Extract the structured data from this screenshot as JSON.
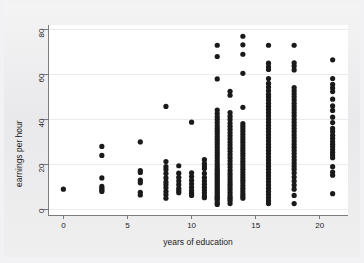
{
  "chart_data": {
    "type": "scatter",
    "title": "",
    "xlabel": "years of education",
    "ylabel": "earnings per hour",
    "xlim": [
      -1.2,
      22.2
    ],
    "ylim": [
      -2.5,
      82
    ],
    "xticks": [
      0,
      5,
      10,
      15,
      20
    ],
    "xtick_labels": [
      "0",
      "5",
      "10",
      "15",
      "20"
    ],
    "yticks": [
      0,
      20,
      40,
      60,
      80
    ],
    "ytick_labels": [
      "0",
      "20",
      "40",
      "60",
      "80"
    ],
    "grid": "horizontal",
    "grid_color": "#e6e6e6",
    "marker": "circle",
    "marker_color": "#1a1a1a",
    "marker_size": 2.6,
    "legend": "none",
    "background": "#ffffff",
    "figure_background": "#ececee",
    "series": [
      {
        "name": "earnings vs education",
        "points_by_x": [
          {
            "x": 0,
            "y": [
              9.0
            ]
          },
          {
            "x": 3,
            "y": [
              28.0,
              24.0,
              14.0,
              10.2,
              9.4,
              8.6,
              8.0
            ]
          },
          {
            "x": 6,
            "y": [
              30.0,
              17.3,
              16.4,
              13.0,
              11.8,
              7.6,
              6.4
            ]
          },
          {
            "x": 8,
            "y": [
              45.8,
              21.3,
              19.0,
              17.7,
              16.0,
              14.0,
              12.2,
              11.0,
              9.6,
              8.0,
              6.6,
              5.0
            ]
          },
          {
            "x": 9,
            "y": [
              19.4,
              16.1,
              14.2,
              12.6,
              11.0,
              9.3,
              8.2,
              7.4
            ]
          },
          {
            "x": 10,
            "y": [
              38.8,
              16.3,
              14.6,
              12.9,
              11.4,
              9.8,
              8.4,
              7.2,
              6.2
            ]
          },
          {
            "x": 11,
            "y": [
              22.1,
              20.4,
              19.3,
              18.2,
              16.0,
              14.1,
              12.6,
              11.2,
              9.8,
              8.6,
              7.4,
              6.0,
              5.2
            ]
          },
          {
            "x": 12,
            "y": [
              73.0,
              68.0,
              58.0,
              44.2,
              42.6,
              41.2,
              40.0,
              38.6,
              37.2,
              36.0,
              34.8,
              33.6,
              32.4,
              31.2,
              30.0,
              28.8,
              27.6,
              26.4,
              25.2,
              24.0,
              22.8,
              21.6,
              20.4,
              19.2,
              18.0,
              17.2,
              16.4,
              15.6,
              14.8,
              14.0,
              13.2,
              12.4,
              11.6,
              10.8,
              10.0,
              9.2,
              8.4,
              7.6,
              6.8,
              6.0,
              5.4,
              4.8,
              4.2,
              3.0,
              2.2
            ]
          },
          {
            "x": 13,
            "y": [
              52.5,
              50.8,
              43.0,
              41.4,
              40.0,
              38.4,
              37.0,
              35.6,
              34.2,
              32.8,
              31.4,
              30.0,
              28.6,
              27.2,
              25.8,
              24.4,
              23.0,
              21.6,
              20.2,
              18.8,
              17.4,
              16.0,
              14.8,
              13.6,
              12.4,
              11.2,
              10.0,
              8.8,
              7.6,
              6.4,
              5.4,
              4.6,
              3.8,
              2.6
            ]
          },
          {
            "x": 14,
            "y": [
              77.0,
              73.2,
              69.0,
              60.5,
              45.4,
              38.2,
              37.0,
              35.8,
              34.6,
              33.4,
              32.2,
              31.0,
              29.8,
              28.6,
              27.4,
              26.2,
              25.0,
              23.8,
              22.6,
              21.4,
              20.2,
              19.0,
              17.8,
              16.6,
              15.4,
              14.2,
              13.0,
              11.8,
              10.6,
              9.4,
              8.2,
              7.0,
              6.0,
              5.0
            ]
          },
          {
            "x": 16,
            "y": [
              73.0,
              65.0,
              63.4,
              62.2,
              58.2,
              56.0,
              54.4,
              52.8,
              51.2,
              50.0,
              48.6,
              47.2,
              45.8,
              44.4,
              43.0,
              41.6,
              40.2,
              38.8,
              37.4,
              36.0,
              34.6,
              33.2,
              31.8,
              30.4,
              29.0,
              27.6,
              26.2,
              24.8,
              23.4,
              22.0,
              20.6,
              19.2,
              17.8,
              16.4,
              15.0,
              13.6,
              12.2,
              10.8,
              9.4,
              8.0,
              6.6,
              5.2,
              3.8,
              2.6
            ]
          },
          {
            "x": 18,
            "y": [
              73.0,
              65.2,
              63.8,
              62.0,
              54.2,
              52.8,
              51.4,
              50.0,
              48.6,
              47.2,
              45.8,
              44.4,
              43.0,
              41.6,
              40.2,
              38.8,
              37.4,
              36.0,
              34.6,
              33.2,
              31.8,
              30.4,
              29.0,
              27.6,
              26.2,
              24.8,
              23.4,
              22.0,
              20.6,
              19.2,
              17.8,
              16.2,
              14.4,
              12.6,
              10.8,
              9.0,
              6.2,
              2.6
            ]
          },
          {
            "x": 21,
            "y": [
              66.5,
              58.2,
              55.6,
              54.0,
              52.4,
              49.0,
              46.0,
              44.0,
              41.0,
              38.6,
              36.0,
              34.6,
              33.0,
              31.6,
              30.2,
              29.0,
              27.8,
              26.6,
              25.4,
              24.2,
              23.0,
              19.0,
              16.6,
              15.2,
              7.0
            ]
          }
        ]
      }
    ]
  }
}
